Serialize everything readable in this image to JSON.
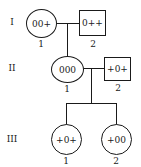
{
  "diagram": {
    "type": "pedigree",
    "generations": [
      {
        "label": "I",
        "members": [
          {
            "index": "1",
            "sex": "female",
            "shape": "circle",
            "genotype": "00+"
          },
          {
            "index": "2",
            "sex": "male",
            "shape": "square",
            "genotype": "0++"
          }
        ]
      },
      {
        "label": "II",
        "members": [
          {
            "index": "1",
            "sex": "female",
            "shape": "circle",
            "genotype": "000"
          },
          {
            "index": "2",
            "sex": "male",
            "shape": "square",
            "genotype": "+0+"
          }
        ]
      },
      {
        "label": "III",
        "members": [
          {
            "index": "1",
            "sex": "female",
            "shape": "circle",
            "genotype": "+0+"
          },
          {
            "index": "2",
            "sex": "female",
            "shape": "circle",
            "genotype": "+00"
          }
        ]
      }
    ]
  }
}
